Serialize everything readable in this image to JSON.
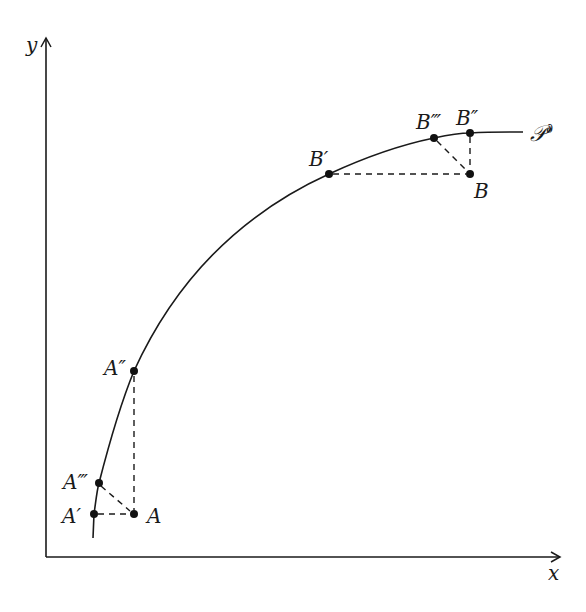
{
  "figure": {
    "axes": {
      "x_label": "x",
      "y_label": "y",
      "origin": [
        46,
        557
      ],
      "x_end": [
        560,
        557
      ],
      "y_end": [
        46,
        38
      ]
    },
    "curve": {
      "label": "𝒫",
      "label_superscript": "∂",
      "path": "M 93 538 L 94 514 C 96 500, 97 490, 99 483 C 110 440, 120 405, 134 371 C 180 270, 250 210, 329 174 C 370 155, 400 145, 434 138 C 448 135, 460 133, 470 133 C 490 132, 508 132, 523 132"
    },
    "points": [
      {
        "id": "A",
        "label": "A",
        "x": 134,
        "y": 514,
        "label_x": 147,
        "label_y": 523
      },
      {
        "id": "A1",
        "label": "A′",
        "x": 94,
        "y": 514,
        "label_x": 62,
        "label_y": 523
      },
      {
        "id": "A2",
        "label": "A″",
        "x": 134,
        "y": 371,
        "label_x": 104,
        "label_y": 375
      },
      {
        "id": "A3",
        "label": "A‴",
        "x": 99,
        "y": 483,
        "label_x": 63,
        "label_y": 489
      },
      {
        "id": "B",
        "label": "B",
        "x": 470,
        "y": 174,
        "label_x": 474,
        "label_y": 198
      },
      {
        "id": "B1",
        "label": "B′",
        "x": 329,
        "y": 174,
        "label_x": 309,
        "label_y": 166
      },
      {
        "id": "B2",
        "label": "B″",
        "x": 470,
        "y": 133,
        "label_x": 456,
        "label_y": 125
      },
      {
        "id": "B3",
        "label": "B‴",
        "x": 434,
        "y": 138,
        "label_x": 416,
        "label_y": 129
      }
    ],
    "dashed_lines": [
      {
        "from": "A1",
        "to": "A",
        "x1": 98,
        "y1": 514,
        "x2": 130,
        "y2": 514
      },
      {
        "from": "A3",
        "to": "A",
        "x1": 101,
        "y1": 486,
        "x2": 130,
        "y2": 511
      },
      {
        "from": "A2",
        "to": "A",
        "x1": 134,
        "y1": 376,
        "x2": 134,
        "y2": 510
      },
      {
        "from": "B1",
        "to": "B",
        "x1": 333,
        "y1": 174,
        "x2": 466,
        "y2": 174
      },
      {
        "from": "B3",
        "to": "B",
        "x1": 437,
        "y1": 141,
        "x2": 467,
        "y2": 171
      },
      {
        "from": "B2",
        "to": "B",
        "x1": 470,
        "y1": 137,
        "x2": 470,
        "y2": 170
      }
    ],
    "colors": {
      "ink": "#1a1a1a",
      "background": "#ffffff"
    }
  }
}
